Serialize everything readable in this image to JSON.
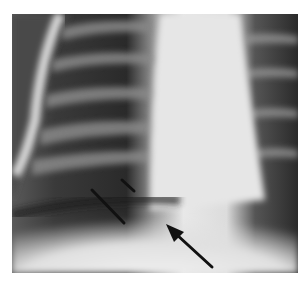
{
  "figure": {
    "type": "chest-radiograph",
    "background_color": "#ffffff",
    "annotations": [
      {
        "name": "arrow-1",
        "style": "line",
        "from": [
          92,
          190
        ],
        "to": [
          124,
          223
        ]
      },
      {
        "name": "arrow-2",
        "style": "line",
        "from": [
          122,
          180
        ],
        "to": [
          134,
          191
        ]
      },
      {
        "name": "arrow-3",
        "style": "arrowhead",
        "tail": [
          212,
          267
        ],
        "head": [
          166,
          224
        ]
      }
    ]
  }
}
